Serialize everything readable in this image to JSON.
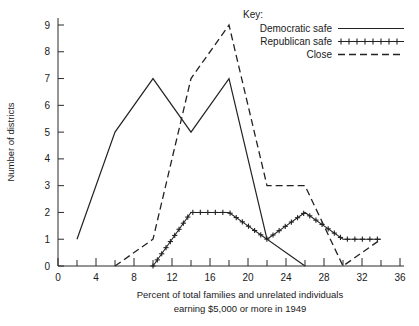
{
  "chart_data": {
    "type": "line",
    "title": "",
    "xlabel": "Percent of total families and unrelated individuals earning $5,000 or more in 1949",
    "xlabel_line1": "Percent of total families and unrelated individuals",
    "xlabel_line2": "earning $5,000 or more in 1949",
    "ylabel": "Number of districts",
    "xlim": [
      0,
      36
    ],
    "ylim": [
      0,
      9
    ],
    "xtick_labels": [
      "0",
      "4",
      "8",
      "12",
      "16",
      "20",
      "24",
      "28",
      "32",
      "36"
    ],
    "xticks_major": [
      0,
      4,
      8,
      12,
      16,
      20,
      24,
      28,
      32,
      36
    ],
    "xticks_minor": [
      2,
      6,
      10,
      14,
      18,
      22,
      26,
      30,
      34
    ],
    "ytick_labels": [
      "0",
      "1",
      "2",
      "3",
      "4",
      "5",
      "6",
      "7",
      "8",
      "9"
    ],
    "yticks": [
      0,
      1,
      2,
      3,
      4,
      5,
      6,
      7,
      8,
      9
    ],
    "grid": false,
    "legend_position": "top-right",
    "legend_title": "Key:",
    "series": [
      {
        "name": "Democratic safe",
        "style": "solid",
        "x": [
          2,
          6,
          10,
          14,
          18,
          22,
          26
        ],
        "values": [
          1,
          5,
          7,
          5,
          7,
          1,
          0
        ]
      },
      {
        "name": "Republican safe",
        "style": "plus",
        "x": [
          10,
          12,
          14,
          16,
          18,
          20,
          22,
          24,
          26,
          28,
          30,
          32,
          34
        ],
        "values": [
          0,
          1,
          2,
          2,
          2,
          1.5,
          1,
          1.5,
          2,
          1.5,
          1,
          1,
          1
        ]
      },
      {
        "name": "Close",
        "style": "dashed",
        "x": [
          6,
          10,
          14,
          18,
          22,
          26,
          30,
          34
        ],
        "values": [
          0,
          1,
          7,
          9,
          3,
          3,
          0,
          1
        ]
      }
    ]
  },
  "legend": {
    "title": "Key:",
    "entries": [
      {
        "label": "Democratic safe",
        "style": "solid"
      },
      {
        "label": "Republican safe",
        "style": "plus"
      },
      {
        "label": "Close",
        "style": "dashed"
      }
    ]
  },
  "axes": {
    "y_axis_title": "Number of districts",
    "x_axis_title_line1": "Percent of total families and unrelated individuals",
    "x_axis_title_line2": "earning $5,000 or more in 1949",
    "y_labels": [
      "9",
      "8",
      "7",
      "6",
      "5",
      "4",
      "3",
      "2",
      "1",
      "0"
    ],
    "x_labels": [
      "0",
      "4",
      "8",
      "12",
      "16",
      "20",
      "24",
      "28",
      "32",
      "36"
    ]
  },
  "colors": {
    "ink": "#222222",
    "background": "#ffffff"
  }
}
